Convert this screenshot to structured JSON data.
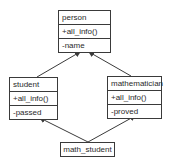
{
  "diagram": {
    "type": "uml-class-diagram",
    "classes": [
      {
        "id": "person",
        "name": "person",
        "methods": [
          "+all_info()"
        ],
        "attributes": [
          "-name"
        ]
      },
      {
        "id": "student",
        "name": "student",
        "methods": [
          "+all_info()"
        ],
        "attributes": [
          "-passed"
        ]
      },
      {
        "id": "mathematician",
        "name": "mathematician",
        "methods": [
          "+all_info()"
        ],
        "attributes": [
          "-proved"
        ]
      },
      {
        "id": "math_student",
        "name": "math_student",
        "methods": [],
        "attributes": []
      }
    ],
    "relations": [
      {
        "from": "student",
        "to": "person",
        "type": "inheritance"
      },
      {
        "from": "mathematician",
        "to": "person",
        "type": "inheritance"
      },
      {
        "from": "math_student",
        "to": "student",
        "type": "inheritance"
      },
      {
        "from": "math_student",
        "to": "mathematician",
        "type": "inheritance"
      }
    ],
    "colors": {
      "line": "#3a3a3a",
      "background": "#ffffff",
      "text": "#2a2a2a"
    }
  }
}
